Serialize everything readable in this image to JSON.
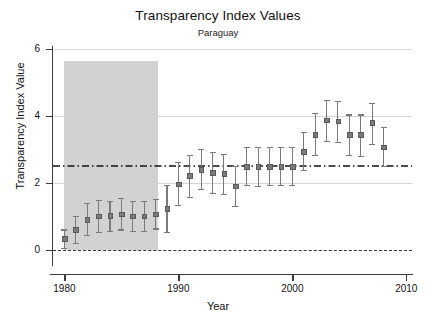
{
  "chart_data": {
    "type": "scatter",
    "title": "Transparency Index Values",
    "subtitle": "Paraguay",
    "xlabel": "Year",
    "ylabel": "Transparency Index Value",
    "xlim": [
      1979,
      2010.5
    ],
    "ylim": [
      -0.35,
      6.0
    ],
    "grid": true,
    "legend": null,
    "y_ticks": [
      0,
      2,
      4,
      6
    ],
    "y_tick_labels": [
      "0",
      "2",
      "4",
      "6"
    ],
    "x_ticks": [
      1980,
      1990,
      2000,
      2010
    ],
    "x_tick_labels": [
      "1980",
      "1990",
      "2000",
      "2010"
    ],
    "reference_line": {
      "name": "mean-reference-line",
      "value": 2.5,
      "style": "dash-dot",
      "color": "#111111"
    },
    "zero_line": {
      "name": "zero-baseline",
      "value": 0,
      "style": "dashed",
      "color": "#333333"
    },
    "shaded_region": {
      "name": "authoritarian-period-band",
      "x_start": 1980,
      "x_end": 1988.25,
      "y_start": 0,
      "y_end": 5.65,
      "color": "#d2d2d2"
    },
    "series": [
      {
        "name": "Transparency Index Value",
        "marker": "point-with-error-bars",
        "color": "#7a7a7a",
        "x": [
          1980,
          1981,
          1982,
          1983,
          1984,
          1985,
          1986,
          1987,
          1988,
          1989,
          1990,
          1991,
          1992,
          1993,
          1994,
          1995,
          1996,
          1997,
          1998,
          1999,
          2000,
          2001,
          2002,
          2003,
          2004,
          2005,
          2006,
          2007,
          2008
        ],
        "y": [
          0.35,
          0.62,
          0.92,
          1.02,
          1.03,
          1.08,
          1.02,
          1.02,
          1.08,
          1.25,
          1.98,
          2.22,
          2.4,
          2.32,
          2.28,
          1.92,
          2.5,
          2.5,
          2.5,
          2.5,
          2.5,
          2.95,
          3.45,
          3.88,
          3.85,
          3.45,
          3.45,
          3.8,
          3.08
        ],
        "y_low": [
          0.08,
          0.22,
          0.45,
          0.55,
          0.58,
          0.62,
          0.58,
          0.58,
          0.65,
          0.55,
          1.35,
          1.6,
          1.82,
          1.72,
          1.68,
          1.32,
          1.95,
          1.92,
          1.95,
          1.95,
          1.95,
          2.4,
          2.85,
          3.25,
          3.22,
          2.85,
          2.82,
          3.18,
          2.5
        ],
        "y_high": [
          0.62,
          1.02,
          1.42,
          1.5,
          1.48,
          1.55,
          1.48,
          1.48,
          1.52,
          1.95,
          2.62,
          2.85,
          3.02,
          2.92,
          2.88,
          2.52,
          3.08,
          3.08,
          3.08,
          3.08,
          3.08,
          3.52,
          4.08,
          4.48,
          4.45,
          4.05,
          4.05,
          4.4,
          3.68
        ]
      }
    ]
  }
}
